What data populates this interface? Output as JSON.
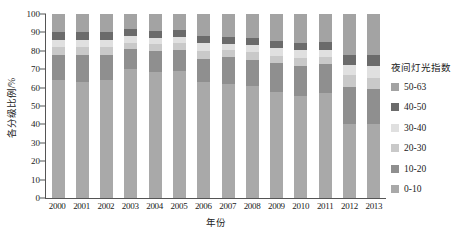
{
  "chart_data": {
    "type": "bar",
    "stacked": true,
    "percent": true,
    "title": "",
    "xlabel": "年份",
    "ylabel": "各分级比例/%",
    "ylim": [
      0,
      100
    ],
    "yticks": [
      0,
      10,
      20,
      30,
      40,
      50,
      60,
      70,
      80,
      90,
      100
    ],
    "grid": false,
    "legend_title": "夜间灯光指数",
    "legend_position": "right",
    "legend_order": [
      "50-63",
      "40-50",
      "30-40",
      "20-30",
      "10-20",
      "0-10"
    ],
    "categories": [
      "2000",
      "2001",
      "2002",
      "2003",
      "2004",
      "2005",
      "2006",
      "2007",
      "2008",
      "2009",
      "2010",
      "2011",
      "2012",
      "2013"
    ],
    "series": [
      {
        "name": "0-10",
        "color": "#a9a9a9",
        "values": [
          64,
          63,
          64,
          70,
          68.5,
          69,
          63,
          62,
          61,
          57.5,
          55.6,
          57.2,
          40.3,
          40
        ]
      },
      {
        "name": "10-20",
        "color": "#8f8f8f",
        "values": [
          14,
          15,
          14,
          11,
          11.5,
          11.5,
          12.6,
          14.5,
          14,
          15.7,
          16.4,
          15.7,
          20.2,
          19.3
        ]
      },
      {
        "name": "20-30",
        "color": "#c9c9c9",
        "values": [
          4,
          4,
          4,
          3.5,
          3.5,
          3.5,
          4.3,
          3.7,
          4.2,
          4.2,
          4.1,
          3.8,
          6.5,
          6.2
        ]
      },
      {
        "name": "30-40",
        "color": "#e0e0e0",
        "values": [
          4,
          4,
          4,
          3.5,
          3.5,
          3.5,
          4.3,
          3.7,
          4.2,
          4.2,
          4.1,
          3.8,
          5.5,
          6
        ]
      },
      {
        "name": "40-50",
        "color": "#6b6b6b",
        "values": [
          4,
          4,
          4,
          4,
          4,
          4,
          3.8,
          3.6,
          3.6,
          4,
          4,
          4.2,
          5.5,
          6
        ]
      },
      {
        "name": "50-63",
        "color": "#a3a3a3",
        "values": [
          10,
          10,
          10,
          8,
          9,
          8.5,
          12,
          12.5,
          13,
          14.4,
          15.8,
          15.3,
          22,
          22.5
        ]
      }
    ]
  }
}
